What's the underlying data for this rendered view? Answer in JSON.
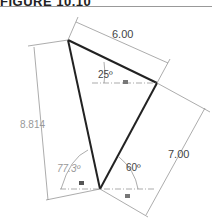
{
  "figure": {
    "title": "FIGURE 10.10"
  },
  "dimensions": {
    "top_edge": "6.00",
    "right_edge": "7.00",
    "left_edge": "8.814",
    "angle_top": "25º",
    "angle_bottom_right": "60º",
    "angle_bottom_left": "77.3º"
  },
  "colors": {
    "edge": "#222222",
    "dim_line": "#888888",
    "driven_text": "#999999"
  }
}
